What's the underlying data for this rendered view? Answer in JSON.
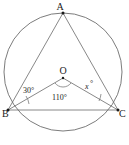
{
  "figure": {
    "type": "circle-geometry-diagram",
    "background_color": "#ffffff",
    "stroke_color": "#5a5a5a",
    "label_color": "#1a1a1a"
  },
  "circle": {
    "name": "circumscribed-circle",
    "center_label": "O",
    "center_x": 63,
    "center_y": 72,
    "radius": 59
  },
  "points": [
    {
      "label": "A",
      "x": 63,
      "y": 13,
      "label_x": 60,
      "label_y": 10
    },
    {
      "label": "B",
      "x": 8,
      "y": 110,
      "label_x": 0,
      "label_y": 117
    },
    {
      "label": "C",
      "x": 118,
      "y": 110,
      "label_x": 119,
      "label_y": 117
    },
    {
      "label": "O",
      "x": 63,
      "y": 78,
      "label_x": 60,
      "label_y": 74
    }
  ],
  "segments": [
    {
      "name": "chord-AB",
      "from": "A",
      "to": "B"
    },
    {
      "name": "chord-AC",
      "from": "A",
      "to": "C"
    },
    {
      "name": "chord-BC",
      "from": "B",
      "to": "C"
    },
    {
      "name": "radius-OB",
      "from": "O",
      "to": "B"
    },
    {
      "name": "radius-OC",
      "from": "O",
      "to": "C"
    }
  ],
  "angles": {
    "angle_at_B": {
      "label": "30°",
      "value": 30,
      "vertex": "B",
      "label_x": 23,
      "label_y": 93
    },
    "angle_at_O": {
      "label": "110°",
      "value": 110,
      "vertex": "O",
      "label_x": 52,
      "label_y": 100
    },
    "angle_at_C": {
      "label": "x",
      "degree_mark": "°",
      "vertex": "C",
      "label_x": 85,
      "label_y": 89
    }
  }
}
